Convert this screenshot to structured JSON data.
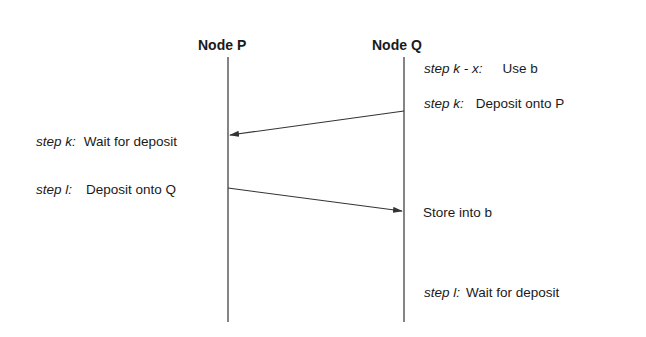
{
  "nodes": {
    "p": {
      "label": "Node  P"
    },
    "q": {
      "label": "Node Q"
    }
  },
  "events": {
    "q_use": {
      "step": "step k - x:",
      "action": "Use b"
    },
    "q_deposit": {
      "step": "step k:",
      "action": "Deposit onto P"
    },
    "p_wait": {
      "step": "step k:",
      "action": "Wait for deposit"
    },
    "p_deposit": {
      "step": "step l:",
      "action": "Deposit onto Q"
    },
    "q_store": {
      "action": "Store into b"
    },
    "q_wait": {
      "step": "step l:",
      "action": "Wait for deposit"
    }
  },
  "messages": [
    {
      "from": "Node Q",
      "to": "Node P",
      "meaning": "deposit onto P"
    },
    {
      "from": "Node P",
      "to": "Node Q",
      "meaning": "deposit onto Q"
    }
  ],
  "colors": {
    "ink": "#1a1a1a",
    "line": "#333333"
  }
}
